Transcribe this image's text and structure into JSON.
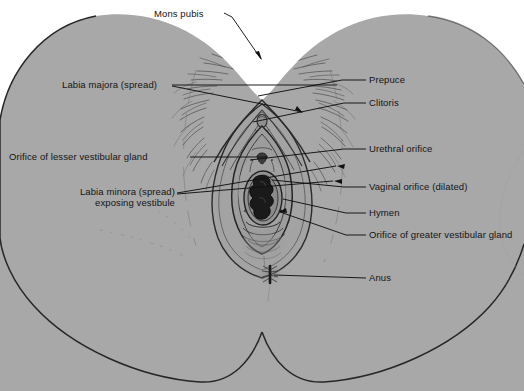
{
  "figure": {
    "colors": {
      "background": "#ffffff",
      "body_fill": "#a8a8a8",
      "body_outline": "#262626",
      "line_color": "#111111",
      "text_color": "#141414",
      "orifice_dark": "#1a1a1a",
      "hair_color": "#4a4a4a"
    }
  },
  "labels": {
    "mons_pubis": "Mons pubis",
    "labia_majora": "Labia majora (spread)",
    "orifice_lesser": "Orifice of lesser vestibular gland",
    "labia_minora_line1": "Labia minora (spread)",
    "labia_minora_line2": "exposing vestibule",
    "prepuce": "Prepuce",
    "clitoris": "Clitoris",
    "urethral_orifice": "Urethral orifice",
    "vaginal_orifice": "Vaginal orifice (dilated)",
    "hymen": "Hymen",
    "orifice_greater": "Orifice of greater vestibular gland",
    "anus": "Anus"
  },
  "callouts": [
    {
      "name": "mons-pubis",
      "side": "left",
      "text_x": 163,
      "text_y": 10,
      "target_x": 258,
      "target_y": 58
    },
    {
      "name": "labia-majora",
      "side": "left",
      "text_x": 62,
      "text_y": 80,
      "target_x": 300,
      "target_y": 85
    },
    {
      "name": "orifice-lesser",
      "side": "left",
      "text_x": 9,
      "text_y": 151,
      "target_x": 262,
      "target_y": 154
    },
    {
      "name": "labia-minora",
      "side": "left",
      "text_x": 60,
      "text_y": 190,
      "target_x": 268,
      "target_y": 178
    },
    {
      "name": "prepuce",
      "side": "right",
      "text_x": 368,
      "text_y": 80,
      "target_x": 264,
      "target_y": 96
    },
    {
      "name": "clitoris",
      "side": "right",
      "text_x": 368,
      "text_y": 103,
      "target_x": 265,
      "target_y": 119
    },
    {
      "name": "urethral-orifice",
      "side": "right",
      "text_x": 368,
      "text_y": 148,
      "target_x": 265,
      "target_y": 158
    },
    {
      "name": "vaginal-orifice",
      "side": "right",
      "text_x": 368,
      "text_y": 187,
      "target_x": 277,
      "target_y": 182
    },
    {
      "name": "hymen",
      "side": "right",
      "text_x": 368,
      "text_y": 213,
      "target_x": 286,
      "target_y": 200
    },
    {
      "name": "orifice-greater",
      "side": "right",
      "text_x": 368,
      "text_y": 235,
      "target_x": 281,
      "target_y": 211
    },
    {
      "name": "anus",
      "side": "right",
      "text_x": 368,
      "text_y": 278,
      "target_x": 271,
      "target_y": 274
    }
  ]
}
